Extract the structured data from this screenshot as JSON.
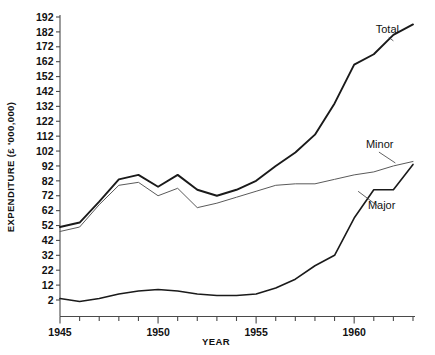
{
  "chart_data": {
    "type": "line",
    "title": "",
    "xlabel": "YEAR",
    "ylabel": "EXPENDITURE (£ '000,000)",
    "xlim": [
      1945,
      1963
    ],
    "ylim": [
      -3,
      192
    ],
    "grid": false,
    "legend_position": "inline-annotations",
    "x": [
      1945,
      1946,
      1947,
      1948,
      1949,
      1950,
      1951,
      1952,
      1953,
      1954,
      1955,
      1956,
      1957,
      1958,
      1959,
      1960,
      1961,
      1962,
      1963
    ],
    "xticks": [
      1945,
      1946,
      1947,
      1948,
      1949,
      1950,
      1951,
      1952,
      1953,
      1954,
      1955,
      1956,
      1957,
      1958,
      1959,
      1960,
      1961,
      1962,
      1963
    ],
    "xtick_labels": [
      "1945",
      "",
      "",
      "",
      "",
      "1950",
      "",
      "",
      "",
      "",
      "1955",
      "",
      "",
      "",
      "",
      "1960",
      "",
      "",
      ""
    ],
    "yticks": [
      2,
      12,
      22,
      32,
      42,
      52,
      62,
      72,
      82,
      92,
      102,
      112,
      122,
      132,
      142,
      152,
      162,
      172,
      182,
      192
    ],
    "ytick_labels": [
      "2",
      "12",
      "22",
      "32",
      "42",
      "52",
      "62",
      "72",
      "82",
      "92",
      "102",
      "112",
      "122",
      "132",
      "142",
      "152",
      "162",
      "172",
      "182",
      "192"
    ],
    "series": [
      {
        "name": "Total",
        "label": "Total",
        "color": "#1a1a1a",
        "values": [
          51,
          54,
          68,
          83,
          86,
          78,
          86,
          76,
          72,
          76,
          82,
          92,
          101,
          113,
          134,
          160,
          167,
          180,
          187
        ]
      },
      {
        "name": "Minor",
        "label": "Minor",
        "color": "#5a5a5a",
        "values": [
          48,
          51,
          66,
          79,
          81,
          72,
          77,
          64,
          67,
          71,
          75,
          79,
          80,
          80,
          83,
          86,
          88,
          92,
          95
        ]
      },
      {
        "name": "Major",
        "label": "Major",
        "color": "#1a1a1a",
        "values": [
          3,
          1,
          3,
          6,
          8,
          9,
          8,
          6,
          5,
          5,
          6,
          10,
          16,
          25,
          32,
          57,
          76,
          76,
          93
        ]
      }
    ],
    "annotations": [
      {
        "text": "Total",
        "series": "Total",
        "x": 1961.1,
        "y": 181,
        "anchor_x": 1962.0,
        "anchor_y": 176
      },
      {
        "text": "Minor",
        "series": "Minor",
        "x": 1960.6,
        "y": 104,
        "anchor_x": 1962.1,
        "anchor_y": 94
      },
      {
        "text": "Major",
        "series": "Major",
        "x": 1960.7,
        "y": 63,
        "anchor_x": 1960.2,
        "anchor_y": 75
      }
    ]
  }
}
